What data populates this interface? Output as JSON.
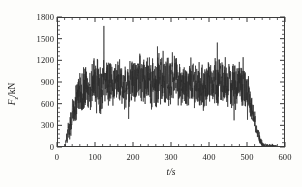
{
  "figure": {
    "background_color": "#fdfdfb",
    "plot_background_color": "#ffffff",
    "frame_color": "#3a3a3a",
    "series_color": "#2b2b2b"
  },
  "axes": {
    "x_title": "t/s",
    "y_title_symbol": "F",
    "y_title_subscript": "z",
    "y_title_unit": "/kN",
    "x_ticks": [
      "0",
      "100",
      "200",
      "300",
      "400",
      "500",
      "600"
    ],
    "y_ticks": [
      "0",
      "300",
      "600",
      "900",
      "1200",
      "1500",
      "1800"
    ],
    "x_minor_per_major": 5,
    "y_minor_per_major": 5
  },
  "chart_data": {
    "type": "line",
    "title": "",
    "xlabel": "t/s",
    "ylabel": "F_z/kN",
    "xlim": [
      0,
      600
    ],
    "ylim": [
      0,
      1800
    ],
    "grid": false,
    "legend": null,
    "x_tick_values": [
      0,
      100,
      200,
      300,
      400,
      500,
      600
    ],
    "y_tick_values": [
      0,
      300,
      600,
      900,
      1200,
      1500,
      1800
    ],
    "series": [
      {
        "name": "Fz",
        "envelope_keyframes": [
          {
            "t": 0,
            "mean": 5,
            "amp": 5
          },
          {
            "t": 18,
            "mean": 10,
            "amp": 10
          },
          {
            "t": 22,
            "mean": 120,
            "amp": 120
          },
          {
            "t": 30,
            "mean": 300,
            "amp": 230
          },
          {
            "t": 40,
            "mean": 480,
            "amp": 330
          },
          {
            "t": 55,
            "mean": 700,
            "amp": 400
          },
          {
            "t": 70,
            "mean": 830,
            "amp": 430
          },
          {
            "t": 90,
            "mean": 890,
            "amp": 470
          },
          {
            "t": 110,
            "mean": 900,
            "amp": 500
          },
          {
            "t": 140,
            "mean": 900,
            "amp": 470
          },
          {
            "t": 170,
            "mean": 890,
            "amp": 450
          },
          {
            "t": 200,
            "mean": 900,
            "amp": 440
          },
          {
            "t": 230,
            "mean": 930,
            "amp": 470
          },
          {
            "t": 260,
            "mean": 960,
            "amp": 520
          },
          {
            "t": 285,
            "mean": 950,
            "amp": 540
          },
          {
            "t": 310,
            "mean": 900,
            "amp": 460
          },
          {
            "t": 340,
            "mean": 880,
            "amp": 420
          },
          {
            "t": 370,
            "mean": 890,
            "amp": 430
          },
          {
            "t": 400,
            "mean": 900,
            "amp": 440
          },
          {
            "t": 430,
            "mean": 910,
            "amp": 480
          },
          {
            "t": 460,
            "mean": 900,
            "amp": 460
          },
          {
            "t": 485,
            "mean": 880,
            "amp": 430
          },
          {
            "t": 500,
            "mean": 780,
            "amp": 330
          },
          {
            "t": 512,
            "mean": 520,
            "amp": 220
          },
          {
            "t": 522,
            "mean": 280,
            "amp": 150
          },
          {
            "t": 532,
            "mean": 110,
            "amp": 80
          },
          {
            "t": 540,
            "mean": 45,
            "amp": 40
          },
          {
            "t": 550,
            "mean": 30,
            "amp": 30
          },
          {
            "t": 565,
            "mean": 35,
            "amp": 35
          },
          {
            "t": 575,
            "mean": 20,
            "amp": 20
          },
          {
            "t": 578,
            "mean": 5,
            "amp": 5
          },
          {
            "t": 600,
            "mean": 0,
            "amp": 0
          }
        ],
        "global_max": 1660,
        "global_min": 0,
        "plateau_mean": 900,
        "sample_step_s": 0.35
      }
    ]
  }
}
